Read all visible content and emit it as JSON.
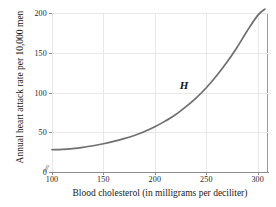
{
  "chart_data": {
    "type": "line",
    "title": "",
    "xlabel": "Blood cholesterol (in milligrams per deciliter)",
    "ylabel": "Annual heart attack rate per 10,000 men",
    "xlim": [
      100,
      310
    ],
    "ylim": [
      0,
      200
    ],
    "xticks": [
      100,
      150,
      200,
      250,
      300
    ],
    "yticks": [
      0,
      50,
      100,
      150,
      200
    ],
    "xtick_labels": [
      "100",
      "150",
      "200",
      "250",
      "300"
    ],
    "ytick_labels": [
      "0",
      "50",
      "100",
      "150",
      "200"
    ],
    "grid": true,
    "axis_break": "//",
    "series": [
      {
        "name": "H",
        "label": "H",
        "color": "#6f6f6f",
        "x": [
          100,
          110,
          120,
          130,
          140,
          150,
          160,
          170,
          180,
          190,
          200,
          210,
          220,
          230,
          240,
          250,
          260,
          270,
          280,
          290,
          300,
          307
        ],
        "y": [
          28,
          28.5,
          29.5,
          31,
          33,
          35.5,
          38.5,
          42,
          46,
          51,
          57,
          64,
          72,
          82,
          93,
          106,
          121,
          138,
          157,
          178,
          197,
          205
        ]
      }
    ],
    "annotations": [
      {
        "text": "H",
        "x": 228,
        "y": 108
      }
    ],
    "legend": "none",
    "curve_color": "#6f6f6f",
    "grid_color": "#e8e8e8",
    "axis_color": "#8d8d8d"
  }
}
